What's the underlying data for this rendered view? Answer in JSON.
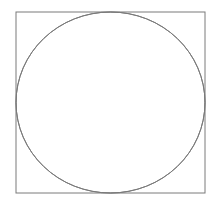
{
  "diagram": {
    "stroke_color": "#7a7a7a",
    "square": {
      "x": 16,
      "y": 12,
      "width": 189,
      "height": 181
    },
    "circle": {
      "cx": 110.5,
      "cy": 102.5,
      "rx": 94.5,
      "ry": 90.5
    },
    "arcs": [
      {
        "name": "top-left",
        "from": [
          110.5,
          12
        ],
        "to": [
          16,
          102.5
        ],
        "rx": 94.5,
        "ry": 90.5,
        "sweep": 0
      },
      {
        "name": "top-right",
        "from": [
          110.5,
          12
        ],
        "to": [
          205,
          102.5
        ],
        "rx": 94.5,
        "ry": 90.5,
        "sweep": 1
      },
      {
        "name": "bottom-left",
        "from": [
          16,
          102.5
        ],
        "to": [
          110.5,
          193
        ],
        "rx": 94.5,
        "ry": 90.5,
        "sweep": 0
      },
      {
        "name": "bottom-right",
        "from": [
          205,
          102.5
        ],
        "to": [
          110.5,
          193
        ],
        "rx": 94.5,
        "ry": 90.5,
        "sweep": 1
      }
    ]
  }
}
